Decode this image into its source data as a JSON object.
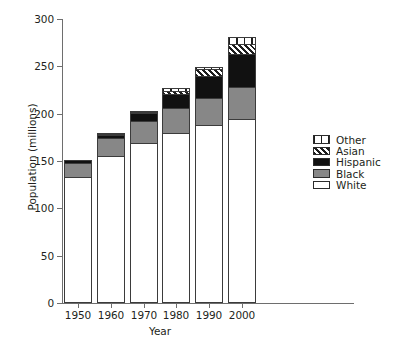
{
  "chart_data": {
    "type": "bar",
    "subtype": "stacked-vertical",
    "title": "",
    "xlabel": "Year",
    "ylabel": "Population (millions)",
    "categories": [
      "1950",
      "1960",
      "1970",
      "1980",
      "1990",
      "2000"
    ],
    "ylim": [
      0,
      300
    ],
    "yticks": [
      0,
      50,
      100,
      150,
      200,
      250,
      300
    ],
    "ytick_labels": [
      "0",
      "50",
      "100",
      "150",
      "200",
      "250",
      "300"
    ],
    "grid": false,
    "legend_position": "right",
    "stack_order_bottom_to_top": [
      "White",
      "Black",
      "Hispanic",
      "Asian",
      "Other"
    ],
    "series": [
      {
        "name": "White",
        "pattern": "solid-white",
        "color": "#ffffff",
        "values": [
          133,
          155,
          169,
          180,
          188,
          194
        ]
      },
      {
        "name": "Black",
        "pattern": "solid-gray",
        "color": "#878787",
        "values": [
          15,
          19,
          23,
          26,
          29,
          34
        ]
      },
      {
        "name": "Hispanic",
        "pattern": "solid-black",
        "color": "#111111",
        "values": [
          3,
          3,
          9,
          15,
          23,
          35
        ]
      },
      {
        "name": "Asian",
        "pattern": "diagonal-hatch",
        "color": "#ffffff",
        "values": [
          0,
          1,
          1,
          3,
          7,
          11
        ]
      },
      {
        "name": "Other",
        "pattern": "vertical-lines",
        "color": "#ffffff",
        "values": [
          0,
          2,
          1,
          3,
          2,
          7
        ]
      }
    ],
    "totals": [
      151,
      180,
      203,
      227,
      249,
      281
    ]
  },
  "legend": {
    "items": [
      {
        "label": "Other",
        "pattern": "vertical-lines"
      },
      {
        "label": "Asian",
        "pattern": "diagonal-hatch"
      },
      {
        "label": "Hispanic",
        "pattern": "solid-black"
      },
      {
        "label": "Black",
        "pattern": "solid-gray"
      },
      {
        "label": "White",
        "pattern": "solid-white"
      }
    ]
  },
  "axes": {
    "y_title": "Population (millions)",
    "x_title": "Year"
  },
  "colors": {
    "axis": "#6e6e6e",
    "text": "#231f20",
    "black_series": "#878787",
    "hispanic_series": "#111111",
    "outline": "#3b3b3b"
  }
}
